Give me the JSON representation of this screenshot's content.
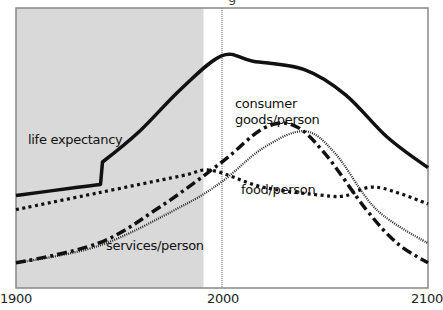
{
  "title_fragment": "g",
  "chart_data": {
    "type": "line",
    "title": "",
    "xlabel": "",
    "ylabel": "",
    "xlim": [
      1900,
      2100
    ],
    "ylim": [
      0,
      100
    ],
    "x_ticks": [
      "1900",
      "2000",
      "2100"
    ],
    "grid": false,
    "legend": "inline labels",
    "shaded_region": {
      "from": 1900,
      "to": 1991,
      "color": "#d9d9d9"
    },
    "reference_line": {
      "x": 2000,
      "style": "dotted"
    },
    "series": [
      {
        "name": "life expectancy",
        "style": "solid-thick",
        "points": [
          [
            1900,
            33
          ],
          [
            1930,
            36
          ],
          [
            1941,
            37
          ],
          [
            1942,
            45
          ],
          [
            1960,
            56
          ],
          [
            1980,
            71
          ],
          [
            2000,
            83
          ],
          [
            2015,
            81
          ],
          [
            2040,
            78
          ],
          [
            2060,
            69
          ],
          [
            2080,
            54
          ],
          [
            2100,
            43
          ]
        ]
      },
      {
        "name": "food/person",
        "style": "dotted-thick",
        "points": [
          [
            1900,
            28
          ],
          [
            1940,
            34
          ],
          [
            1980,
            40
          ],
          [
            1995,
            42
          ],
          [
            2020,
            36
          ],
          [
            2050,
            33
          ],
          [
            2060,
            33
          ],
          [
            2075,
            36
          ],
          [
            2100,
            30
          ]
        ]
      },
      {
        "name": "consumer goods/person",
        "style": "dash-dot-thick",
        "points": [
          [
            1900,
            9
          ],
          [
            1940,
            16
          ],
          [
            1970,
            29
          ],
          [
            2000,
            45
          ],
          [
            2020,
            57
          ],
          [
            2035,
            58
          ],
          [
            2050,
            48
          ],
          [
            2070,
            28
          ],
          [
            2085,
            16
          ],
          [
            2100,
            9
          ]
        ]
      },
      {
        "name": "services/person",
        "style": "dotted-fine",
        "points": [
          [
            1900,
            9
          ],
          [
            1940,
            15
          ],
          [
            1980,
            29
          ],
          [
            2000,
            38
          ],
          [
            2020,
            50
          ],
          [
            2040,
            56
          ],
          [
            2055,
            48
          ],
          [
            2075,
            28
          ],
          [
            2100,
            16
          ]
        ]
      }
    ]
  },
  "labels": {
    "life": "life expectancy",
    "consumer_1": "consumer",
    "consumer_2": "goods/person",
    "food": "food/person",
    "services": "services/person"
  },
  "axis": {
    "x0": "1900",
    "x1": "2000",
    "x2": "2100"
  }
}
